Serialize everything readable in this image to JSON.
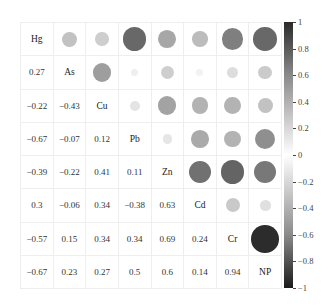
{
  "chart_data": {
    "type": "heatmap",
    "subtype": "correlation-matrix",
    "title": "",
    "variables": [
      "Hg",
      "As",
      "Cu",
      "Pb",
      "Zn",
      "Cd",
      "Cr",
      "NP"
    ],
    "matrix": [
      [
        1,
        0.27,
        -0.22,
        -0.67,
        -0.39,
        0.3,
        -0.57,
        -0.67
      ],
      [
        0.27,
        1,
        -0.43,
        -0.07,
        -0.22,
        -0.06,
        0.15,
        0.23
      ],
      [
        -0.22,
        -0.43,
        1,
        0.12,
        0.41,
        0.34,
        0.34,
        0.27
      ],
      [
        -0.67,
        -0.07,
        0.12,
        1,
        0.11,
        -0.38,
        0.34,
        0.5
      ],
      [
        -0.39,
        -0.22,
        0.41,
        0.11,
        1,
        0.63,
        0.69,
        0.6
      ],
      [
        0.3,
        -0.06,
        0.34,
        -0.38,
        0.63,
        1,
        0.24,
        0.14
      ],
      [
        -0.57,
        0.15,
        0.34,
        0.34,
        0.69,
        0.24,
        1,
        0.94
      ],
      [
        -0.67,
        0.23,
        0.27,
        0.5,
        0.6,
        0.14,
        0.94,
        1
      ]
    ],
    "lower_triangle": "numbers",
    "upper_triangle": "circles",
    "diagonal": "variable names",
    "colorbar": {
      "ticks": [
        1,
        0.8,
        0.6,
        0.4,
        0.2,
        0,
        -0.2,
        -0.4,
        -0.6,
        -0.8,
        -1
      ],
      "tick_labels": [
        "1",
        "0.8",
        "0.6",
        "0.4",
        "0.2",
        "0",
        "−0.2",
        "−0.4",
        "−0.6",
        "−0.8",
        "−1"
      ],
      "range": [
        -1,
        1
      ],
      "colormap": "grayscale, dark at ±1, white at 0"
    },
    "grid": true,
    "legend_position": "right"
  }
}
